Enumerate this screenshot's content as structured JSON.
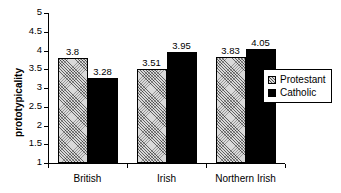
{
  "chart_data": {
    "type": "bar",
    "title": "",
    "xlabel": "",
    "ylabel": "prototypicality",
    "categories": [
      "British",
      "Irish",
      "Northern Irish"
    ],
    "series": [
      {
        "name": "Protestant",
        "values": [
          3.8,
          3.51,
          3.83
        ],
        "labels": [
          "3.8",
          "3.51",
          "3.83"
        ],
        "fill": "hatched",
        "color": "#d9d9d9"
      },
      {
        "name": "Catholic",
        "values": [
          3.28,
          3.95,
          4.05
        ],
        "labels": [
          "3.28",
          "3.95",
          "4.05"
        ],
        "fill": "solid",
        "color": "#000000"
      }
    ],
    "ylim": [
      1,
      5
    ],
    "yticks": [
      1,
      1.5,
      2,
      2.5,
      3,
      3.5,
      4,
      4.5,
      5
    ],
    "ytick_labels": [
      "1",
      "1.5",
      "2",
      "2.5",
      "3",
      "3.5",
      "4",
      "4.5",
      "5"
    ],
    "grid": false,
    "legend_position": "right",
    "value_labels_shown": true
  }
}
